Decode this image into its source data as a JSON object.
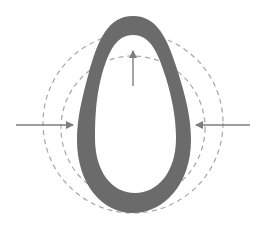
{
  "diagram": {
    "type": "egg-shaped ring compressed by inward forces, with dashed reference circles",
    "colors": {
      "ring_fill": "#6b6b6b",
      "dashed_circle": "#a6a6a6",
      "arrow": "#7d7d7d",
      "background": "#ffffff"
    },
    "shapes": {
      "outer_dashed_circle": {
        "cx": 133,
        "cy": 123,
        "r": 90
      },
      "inner_dashed_circle": {
        "cx": 133,
        "cy": 128,
        "r": 72
      },
      "egg_ring": {
        "outer": {
          "top": 16,
          "bottom": 213,
          "left": 77,
          "right": 190
        },
        "inner": {
          "top": 35,
          "bottom": 193,
          "left": 95,
          "right": 176
        }
      }
    },
    "arrows": [
      {
        "id": "left-arrow",
        "direction": "right",
        "from": [
          16,
          125
        ],
        "to": [
          73,
          125
        ]
      },
      {
        "id": "right-arrow",
        "direction": "left",
        "from": [
          250,
          125
        ],
        "to": [
          196,
          125
        ]
      },
      {
        "id": "up-arrow",
        "direction": "up",
        "from": [
          133,
          86
        ],
        "to": [
          133,
          51
        ]
      }
    ]
  }
}
